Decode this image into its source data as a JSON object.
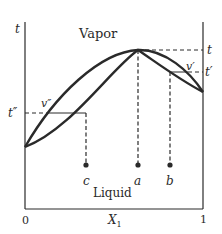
{
  "diagram": {
    "type": "phase-diagram",
    "axes": {
      "y_label": "t",
      "x_label": "X",
      "x_label_subscript": "1",
      "x_tick_left": "0",
      "x_tick_right": "1"
    },
    "regions": {
      "top": "Vapor",
      "bottom": "Liquid"
    },
    "temperature_labels": {
      "t": "t",
      "t_prime": "t′",
      "t_double_prime": "t″"
    },
    "vapor_labels": {
      "v_prime": "v′",
      "v_double_prime": "v″"
    },
    "points": [
      {
        "name": "c",
        "label": "c"
      },
      {
        "name": "a",
        "label": "a"
      },
      {
        "name": "b",
        "label": "b"
      }
    ],
    "colors": {
      "line": "#2a2a2a",
      "background": "#ffffff"
    }
  }
}
